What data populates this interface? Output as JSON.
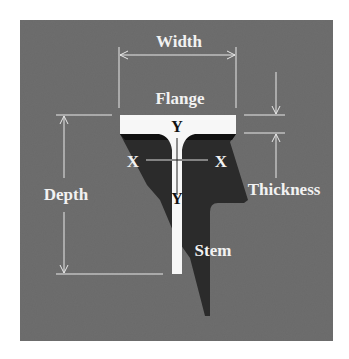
{
  "diagram": {
    "labels": {
      "width": "Width",
      "flange": "Flange",
      "depth": "Depth",
      "thickness": "Thickness",
      "stem": "Stem",
      "x_left": "X",
      "x_right": "X",
      "y_top": "Y",
      "y_bottom": "Y"
    },
    "colors": {
      "background_panel": "#6e6e6e",
      "beam_face": "#f5f5f5",
      "beam_shadow": "#2a2a2a",
      "dimension_lines": "#e8e8e8",
      "label_text": "#f2f2f2",
      "axis_text_on_beam": "#111111"
    }
  }
}
